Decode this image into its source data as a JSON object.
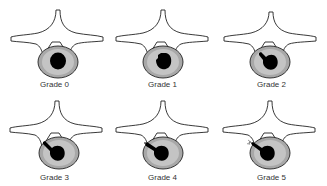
{
  "diagram": {
    "type": "vertebra-disc-grading",
    "colors": {
      "outline": "#222222",
      "annulus": "#a8a8a8",
      "annulus_inner": "#c8c8c8",
      "nucleus": "#000000",
      "background": "#ffffff"
    },
    "panels": [
      {
        "label": "Grade 0",
        "grade": 0
      },
      {
        "label": "Grade 1",
        "grade": 1
      },
      {
        "label": "Grade 2",
        "grade": 2
      },
      {
        "label": "Grade 3",
        "grade": 3
      },
      {
        "label": "Grade 4",
        "grade": 4
      },
      {
        "label": "Grade 5",
        "grade": 5
      }
    ]
  }
}
